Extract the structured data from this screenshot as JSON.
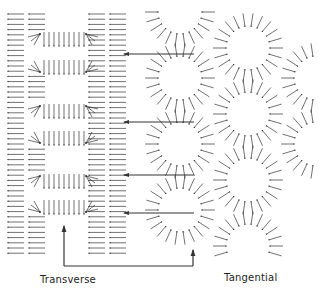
{
  "labels": {
    "transverse": "Transverse",
    "tangential": "Tangential"
  },
  "colors": {
    "ink": "#333333",
    "background": "#ffffff"
  },
  "transverse": {
    "columns_x": [
      8,
      29,
      89,
      110
    ],
    "row_start_y": 14,
    "row_end_y": 258,
    "row_step": 5.2,
    "vector_length": 16,
    "square_openings": [
      {
        "x1": 40,
        "x2": 86,
        "y1": 34,
        "y2": 72
      },
      {
        "x1": 40,
        "x2": 86,
        "y1": 106,
        "y2": 143
      },
      {
        "x1": 40,
        "x2": 86,
        "y1": 176,
        "y2": 212
      }
    ]
  },
  "tangential": {
    "circles": [
      {
        "cx": 180,
        "cy": 78,
        "r": 22
      },
      {
        "cx": 248,
        "cy": 48,
        "r": 22
      },
      {
        "cx": 180,
        "cy": 144,
        "r": 22
      },
      {
        "cx": 248,
        "cy": 114,
        "r": 22
      },
      {
        "cx": 180,
        "cy": 210,
        "r": 22
      },
      {
        "cx": 248,
        "cy": 180,
        "r": 22
      },
      {
        "cx": 316,
        "cy": 78,
        "r": 22
      },
      {
        "cx": 316,
        "cy": 144,
        "r": 22
      },
      {
        "cx": 248,
        "cy": 246,
        "r": 22
      },
      {
        "cx": 180,
        "cy": 12,
        "r": 22
      }
    ],
    "vector_length": 13
  },
  "arrows": [
    {
      "x1": 124,
      "y1": 54,
      "x2": 194,
      "y2": 54
    },
    {
      "x1": 124,
      "y1": 122,
      "x2": 194,
      "y2": 122
    },
    {
      "x1": 124,
      "y1": 175,
      "x2": 194,
      "y2": 175
    },
    {
      "x1": 124,
      "y1": 213,
      "x2": 194,
      "y2": 213
    }
  ],
  "bracket": {
    "left_x": 64,
    "right_x": 193,
    "bottom_y": 266,
    "left_top_y": 226,
    "right_top_y": 250
  }
}
